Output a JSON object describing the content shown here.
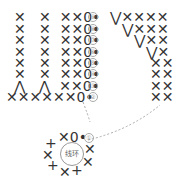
{
  "diagram": {
    "type": "crochet-chart",
    "rows": [
      {
        "row": 9,
        "label": "⑨",
        "left": "✕   ✕  ✕✕0•",
        "right": "⋁✕✕✕✕"
      },
      {
        "row": 8,
        "label": "⑧",
        "left": "✕   ✕  ✕✕0•",
        "right": "⋁✕✕✕"
      },
      {
        "row": 7,
        "label": "⑦",
        "left": "✕   ✕  ✕✕0•",
        "right": "⋁✕✕"
      },
      {
        "row": 6,
        "label": "⑥",
        "left": "✕   ✕  ✕✕0•",
        "right": "⋁✕"
      },
      {
        "row": 5,
        "label": "⑤",
        "left": "✕   ✕  ✕✕0•",
        "right": "✕✕"
      },
      {
        "row": 4,
        "label": "④",
        "left": "✕   ✕  ✕✕0•",
        "right": "✕✕"
      },
      {
        "row": 3,
        "label": "③",
        "left": "⋀   ⋀  ✕✕0•",
        "right": "✕✕"
      },
      {
        "row": 2,
        "label": "②",
        "left": "✕✕✕✕✕✕0•",
        "right": "✕✕"
      },
      {
        "row": 1,
        "label": "①",
        "left": "✕0•",
        "right": ""
      }
    ],
    "ring_label": "线环",
    "colors": {
      "symbol": "#333333",
      "number": "#999999",
      "dashed_line": "#aaaaaa"
    }
  }
}
